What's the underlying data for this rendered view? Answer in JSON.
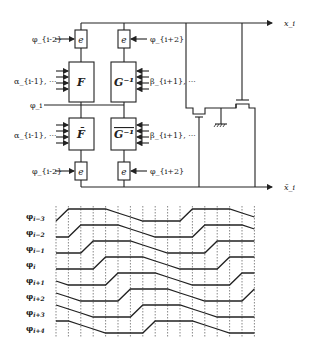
{
  "circuit": {
    "output_top": "x_i",
    "output_bottom": "x̄_i",
    "phi_mid": "φ_i",
    "top_left_input": "φ_{i-2}",
    "top_right_input": "φ_{i+2}",
    "bottom_left_input": "φ_{i-2}",
    "bottom_right_input": "φ_{i+2}",
    "alpha_top": "α_{i-1}, ···",
    "alpha_bottom": "α_{i-1}, ···",
    "beta_top": "β_{i+1}, ···",
    "beta_bottom": "β_{i+1}, ···",
    "blocks": {
      "e_top_left": "e",
      "e_top_right": "e",
      "F": "F",
      "G_inv": "G⁻¹",
      "F_bar": "F̄",
      "G_inv_bar": "G⁻¹",
      "e_bottom_left": "e",
      "e_bottom_right": "e"
    }
  },
  "timing": {
    "signals": [
      {
        "label": "φ",
        "sub": "i−3"
      },
      {
        "label": "φ",
        "sub": "i−2"
      },
      {
        "label": "φ",
        "sub": "i−1"
      },
      {
        "label": "φ",
        "sub": "i"
      },
      {
        "label": "φ",
        "sub": "i+1"
      },
      {
        "label": "φ",
        "sub": "i+2"
      },
      {
        "label": "φ",
        "sub": "i+3"
      },
      {
        "label": "φ",
        "sub": "i+4"
      }
    ],
    "grid_lines": 17
  }
}
